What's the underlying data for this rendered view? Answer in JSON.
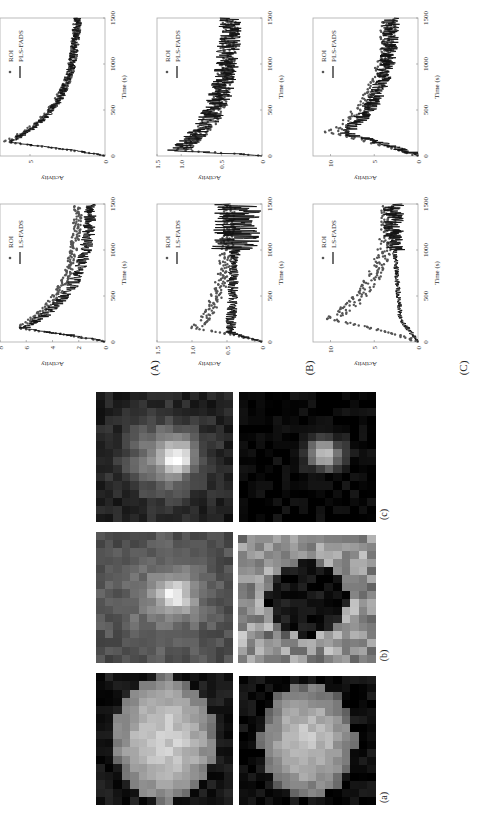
{
  "figure": {
    "orientation": "rotated 90 degrees counter-clockwise",
    "row_labels": [
      "(A)",
      "(B)",
      "(C)"
    ],
    "image_labels": [
      "(a)",
      "(b)",
      "(c)"
    ]
  },
  "chart_data": [
    {
      "id": "A-PLS",
      "type": "line+scatter",
      "row": "(A)",
      "xlabel": "Time (s)",
      "ylabel": "Activity",
      "xlim": [
        0,
        1500
      ],
      "ylim": [
        0,
        7
      ],
      "xticks": [
        "0",
        "500",
        "1000",
        "1500"
      ],
      "yticks": [
        "0",
        "5"
      ],
      "legend": [
        "ROI",
        "PLS-FADS"
      ],
      "legend_position": "top-right",
      "series": [
        {
          "name": "ROI",
          "kind": "scatter",
          "shape": "peak-decay",
          "peak_x": 150,
          "peak_y": 6.6,
          "end_y": 1.7,
          "noise": 0.25
        },
        {
          "name": "PLS-FADS",
          "kind": "line",
          "shape": "peak-decay",
          "peak_x": 150,
          "peak_y": 6.4,
          "end_y": 1.7,
          "noise": 0.3
        }
      ]
    },
    {
      "id": "A-LS",
      "type": "line+scatter",
      "row": "(A)",
      "xlabel": "Time (s)",
      "ylabel": "Activity",
      "xlim": [
        0,
        1500
      ],
      "ylim": [
        0,
        8
      ],
      "xticks": [
        "0",
        "500",
        "1000",
        "1500"
      ],
      "yticks": [
        "0",
        "2",
        "4",
        "6",
        "8"
      ],
      "legend": [
        "ROI",
        "LS-FADS"
      ],
      "legend_position": "top-right",
      "series": [
        {
          "name": "ROI",
          "kind": "scatter",
          "shape": "peak-decay",
          "peak_x": 150,
          "peak_y": 6.6,
          "end_y": 1.9,
          "noise": 0.3
        },
        {
          "name": "LS-FADS",
          "kind": "line",
          "shape": "peak-decay",
          "peak_x": 150,
          "peak_y": 6.3,
          "end_y": 0.9,
          "noise": 0.5
        }
      ]
    },
    {
      "id": "B-PLS",
      "type": "line+scatter",
      "row": "(B)",
      "xlabel": "Time (s)",
      "ylabel": "Activity",
      "xlim": [
        0,
        1500
      ],
      "ylim": [
        0,
        1.3
      ],
      "xticks": [
        "0",
        "500",
        "1000",
        "1500"
      ],
      "yticks": [
        "0",
        "0.5",
        "1.0",
        "1.5"
      ],
      "legend": [
        "ROI",
        "PLS-FADS"
      ],
      "legend_position": "top-right",
      "series": [
        {
          "name": "ROI",
          "kind": "scatter",
          "shape": "peak-decay",
          "peak_x": 60,
          "peak_y": 1.0,
          "end_y": 0.38,
          "noise": 0.1
        },
        {
          "name": "PLS-FADS",
          "kind": "line",
          "shape": "peak-decay",
          "peak_x": 60,
          "peak_y": 1.05,
          "end_y": 0.38,
          "noise": 0.15
        }
      ]
    },
    {
      "id": "B-LS",
      "type": "line+scatter",
      "row": "(B)",
      "xlabel": "Time (s)",
      "ylabel": "Activity",
      "xlim": [
        0,
        1500
      ],
      "ylim": [
        0,
        1.5
      ],
      "xticks": [
        "0",
        "500",
        "1000",
        "1500"
      ],
      "yticks": [
        "0",
        "0.5",
        "1.0",
        "1.5"
      ],
      "legend": [
        "ROI",
        "LS-FADS"
      ],
      "legend_position": "top-right",
      "series": [
        {
          "name": "ROI",
          "kind": "scatter",
          "shape": "peak-decay",
          "peak_x": 150,
          "peak_y": 0.95,
          "end_y": 0.45,
          "noise": 0.09
        },
        {
          "name": "LS-FADS",
          "kind": "line",
          "shape": "flat-noisy",
          "peak_x": 100,
          "peak_y": 0.45,
          "end_y": 0.35,
          "noise": 0.08,
          "late_noise": 0.35
        }
      ]
    },
    {
      "id": "C-PLS",
      "type": "line+scatter",
      "row": "(C)",
      "xlabel": "Time (s)",
      "ylabel": "Activity",
      "xlim": [
        0,
        1500
      ],
      "ylim": [
        0,
        12
      ],
      "xticks": [
        "0",
        "500",
        "1000",
        "1500"
      ],
      "yticks": [
        "0",
        "5",
        "10"
      ],
      "legend": [
        "ROI",
        "PLS-FADS"
      ],
      "legend_position": "top-right",
      "series": [
        {
          "name": "ROI",
          "kind": "scatter",
          "shape": "peak-decay",
          "peak_x": 250,
          "peak_y": 10.0,
          "end_y": 3.0,
          "noise": 0.9
        },
        {
          "name": "PLS-FADS",
          "kind": "line",
          "shape": "peak-decay",
          "peak_x": 250,
          "peak_y": 8.5,
          "end_y": 2.8,
          "noise": 1.0
        }
      ]
    },
    {
      "id": "C-LS",
      "type": "line+scatter",
      "row": "(C)",
      "xlabel": "Time (s)",
      "ylabel": "Activity",
      "xlim": [
        0,
        1500
      ],
      "ylim": [
        0,
        12
      ],
      "xticks": [
        "0",
        "500",
        "1000",
        "1500"
      ],
      "yticks": [
        "0",
        "5",
        "10"
      ],
      "legend": [
        "ROI",
        "LS-FADS"
      ],
      "legend_position": "top-right",
      "series": [
        {
          "name": "ROI",
          "kind": "scatter",
          "shape": "peak-decay",
          "peak_x": 250,
          "peak_y": 10.0,
          "end_y": 3.0,
          "noise": 0.9
        },
        {
          "name": "LS-FADS",
          "kind": "line",
          "shape": "low-rise",
          "peak_x": 250,
          "peak_y": 2.0,
          "end_y": 2.8,
          "noise": 0.3,
          "late_noise": 1.2
        }
      ]
    }
  ],
  "images": [
    {
      "id": "c-top",
      "label": "(c)",
      "pattern": "central-hotspot",
      "background": 0.15
    },
    {
      "id": "c-bottom",
      "label": "(c)",
      "pattern": "small-hotspot",
      "background": 0.02
    },
    {
      "id": "b-top",
      "label": "(b)",
      "pattern": "diffuse-hotspot",
      "background": 0.3
    },
    {
      "id": "b-bottom",
      "label": "(b)",
      "pattern": "dark-hole",
      "background": 0.55
    },
    {
      "id": "a-top",
      "label": "(a)",
      "pattern": "elliptical-organ",
      "background": 0.05
    },
    {
      "id": "a-bottom",
      "label": "(a)",
      "pattern": "elliptical-organ-noisy",
      "background": 0.03
    }
  ]
}
